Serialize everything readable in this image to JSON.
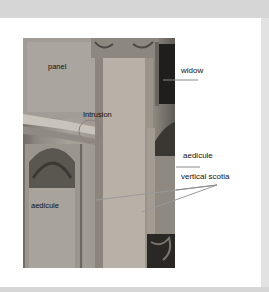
{
  "figure": {
    "type": "annotated-photograph",
    "labels": {
      "panel": "panel",
      "intrusion": "Intrusion",
      "aedicule_left": "aedicule",
      "widow": "widow",
      "aedicule_right": "aedicule",
      "vertical_scotia": "vertical scotia"
    },
    "colors": {
      "background": "#d6d6d6",
      "frame": "#ffffff",
      "leader_line": "#8a8a8a",
      "text": "#111111"
    }
  }
}
